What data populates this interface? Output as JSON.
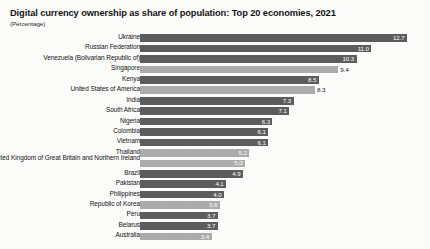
{
  "header": {
    "title": "Digital currency ownership as share of population: Top 20 economies, 2021",
    "subtitle": "(Percentage)"
  },
  "chart_data": {
    "type": "bar",
    "orientation": "horizontal",
    "title": "Digital currency ownership as share of population: Top 20 economies, 2021",
    "subtitle": "(Percentage)",
    "xlabel": "",
    "ylabel": "",
    "unit": "Percentage",
    "grid": false,
    "legend": false,
    "xlim": [
      0,
      13.6
    ],
    "categories": [
      "Ukraine",
      "Russian Federation",
      "Venezuela (Bolivarian Republic of)",
      "Singapore",
      "Kenya",
      "United States of America",
      "India",
      "South Africa",
      "Nigeria",
      "Colombia",
      "Vietnam",
      "Thailand",
      "United Kingdom of Great Britain and Northern Ireland",
      "Brazil",
      "Pakistan",
      "Philippines",
      "Republic of Korea",
      "Peru",
      "Belarus",
      "Australia"
    ],
    "values": [
      12.7,
      11.0,
      10.3,
      9.4,
      8.5,
      8.3,
      7.3,
      7.1,
      6.3,
      6.1,
      6.1,
      5.2,
      5.0,
      4.9,
      4.1,
      4.0,
      3.8,
      3.7,
      3.7,
      3.4
    ],
    "value_labels": [
      "12.7",
      "11.0",
      "10.3",
      "9.4",
      "8.5",
      "8.3",
      "7.3",
      "7.1",
      "6.3",
      "6.1",
      "6.1",
      "5.2",
      "5.0",
      "4.9",
      "4.1",
      "4.0",
      "3.8",
      "3.7",
      "3.7",
      "3.4"
    ],
    "bar_shades": [
      "dark",
      "dark",
      "dark",
      "light",
      "dark",
      "light",
      "dark",
      "dark",
      "dark",
      "dark",
      "dark",
      "light",
      "light",
      "dark",
      "dark",
      "dark",
      "light",
      "dark",
      "dark",
      "light"
    ],
    "label_placement": [
      "inside",
      "inside",
      "inside",
      "outside",
      "inside",
      "outside",
      "inside",
      "inside",
      "inside",
      "inside",
      "inside",
      "inside",
      "inside",
      "inside",
      "inside",
      "inside",
      "inside",
      "inside",
      "inside",
      "inside"
    ],
    "colors": {
      "dark": "#5d5d5d",
      "light": "#adadad",
      "title": "#151515",
      "background": "#fdfdfc"
    }
  }
}
